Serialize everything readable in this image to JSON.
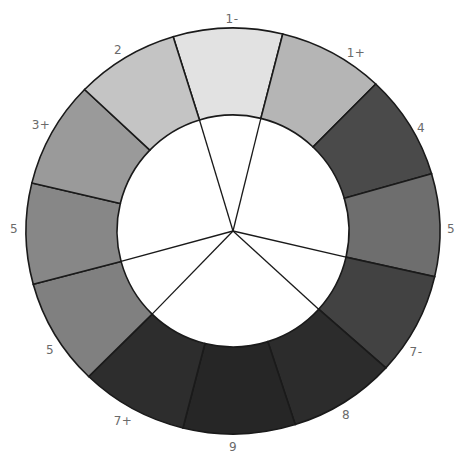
{
  "diagram": {
    "type": "value-wheel",
    "center": [
      233,
      231
    ],
    "outer_radius": [
      207,
      203
    ],
    "inner_radius": 116,
    "segments": [
      {
        "label": "1-",
        "start": 253.2,
        "end": 283.9,
        "color": "#e2e2e2",
        "label_pos": [
          232,
          19
        ]
      },
      {
        "label": "1+",
        "start": 283.9,
        "end": 313.6,
        "color": "#b5b5b5",
        "label_pos": [
          356,
          53
        ]
      },
      {
        "label": "4",
        "start": 313.6,
        "end": 343.6,
        "color": "#4a4a4a",
        "label_pos": [
          421,
          128
        ]
      },
      {
        "label": "5",
        "start": 343.6,
        "end": 373.0,
        "color": "#6e6e6e",
        "label_pos": [
          451,
          229
        ]
      },
      {
        "label": "7-",
        "start": 13.0,
        "end": 42.4,
        "color": "#424242",
        "label_pos": [
          416,
          352
        ]
      },
      {
        "label": "8",
        "start": 42.4,
        "end": 72.5,
        "color": "#2c2c2c",
        "label_pos": [
          346,
          415
        ]
      },
      {
        "label": "9",
        "start": 72.5,
        "end": 104.0,
        "color": "#262626",
        "label_pos": [
          233,
          447
        ]
      },
      {
        "label": "7+",
        "start": 104.0,
        "end": 134.2,
        "color": "#2d2d2d",
        "label_pos": [
          123,
          421
        ]
      },
      {
        "label": "5",
        "start": 134.2,
        "end": 164.8,
        "color": "#808080",
        "label_pos": [
          50,
          350
        ]
      },
      {
        "label": "5",
        "start": 164.8,
        "end": 193.7,
        "color": "#878787",
        "label_pos": [
          14,
          229
        ]
      },
      {
        "label": "3+",
        "start": 193.7,
        "end": 224.2,
        "color": "#9a9a9a",
        "label_pos": [
          41,
          125
        ]
      },
      {
        "label": "2",
        "start": 224.2,
        "end": 253.2,
        "color": "#c4c4c4",
        "label_pos": [
          118,
          50
        ]
      }
    ],
    "spokes_to_center": [
      253.2,
      283.9,
      13.0,
      42.4,
      134.2,
      164.8
    ]
  }
}
